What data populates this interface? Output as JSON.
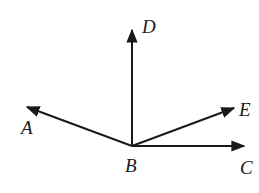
{
  "diagram": {
    "type": "rays from common vertex",
    "vertex": {
      "label": "B",
      "x": 132,
      "y": 146
    },
    "rays": [
      {
        "name": "BD",
        "label": "D",
        "tip": [
          132,
          28
        ],
        "label_pos": [
          143,
          32
        ],
        "direction": "up"
      },
      {
        "name": "BA",
        "label": "A",
        "tip": [
          25,
          106
        ],
        "label_pos": [
          21,
          134
        ],
        "direction": "upper-left"
      },
      {
        "name": "BE",
        "label": "E",
        "tip": [
          236,
          107
        ],
        "label_pos": [
          239,
          116
        ],
        "direction": "upper-right"
      },
      {
        "name": "BC",
        "label": "C",
        "tip": [
          246,
          146
        ],
        "label_pos": [
          239,
          173
        ],
        "direction": "right"
      }
    ],
    "vertex_label_pos": [
      124,
      172
    ],
    "stroke_color": "#1a1a1a"
  }
}
